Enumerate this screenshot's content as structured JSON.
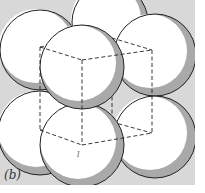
{
  "figure": {
    "caption_label": "(b)",
    "inner_label": "l",
    "colors": {
      "background": "#d8d8d8",
      "margin": "#ffffff",
      "sphere_fill": "#ffffff",
      "sphere_shadow": "#a9a9a9",
      "outline": "#222222"
    },
    "spheres": [
      {
        "id": "back-top-middle",
        "cx": 110,
        "cy": 22,
        "r": 38
      },
      {
        "id": "back-top-left",
        "cx": 40,
        "cy": 50,
        "r": 40
      },
      {
        "id": "back-top-right",
        "cx": 155,
        "cy": 55,
        "r": 41
      },
      {
        "id": "back-bottom-left",
        "cx": 40,
        "cy": 133,
        "r": 42
      },
      {
        "id": "back-bottom-right",
        "cx": 155,
        "cy": 137,
        "r": 41
      },
      {
        "id": "front-top",
        "cx": 82,
        "cy": 67,
        "r": 42
      },
      {
        "id": "front-bottom",
        "cx": 82,
        "cy": 145,
        "r": 42
      }
    ]
  }
}
